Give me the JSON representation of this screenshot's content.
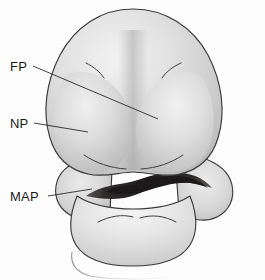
{
  "figure": {
    "background_color": "#fdfdfd",
    "outline_color": "#3a3a3a",
    "fill_light": "#eeeeee",
    "fill_mid": "#c9c9c9",
    "fill_dark": "#a8a8a8",
    "cavity_color": "#221f1f",
    "width": 265,
    "height": 280
  },
  "labels": [
    {
      "id": "fp",
      "text": "FP",
      "meaning": "frontonasal-prominence",
      "text_x": 10,
      "text_y": 71,
      "leader_start_x": 33,
      "leader_start_y": 66,
      "leader_end_x": 158,
      "leader_end_y": 119
    },
    {
      "id": "np",
      "text": "NP",
      "meaning": "nasal-prominence",
      "text_x": 10,
      "text_y": 128,
      "leader_start_x": 34,
      "leader_start_y": 123,
      "leader_end_x": 88,
      "leader_end_y": 132
    },
    {
      "id": "map",
      "text": "MAP",
      "meaning": "maxillary-mandibular-prominence",
      "text_x": 10,
      "text_y": 201,
      "leader_start_x": 48,
      "leader_start_y": 196,
      "leader_end_x": 92,
      "leader_end_y": 189
    }
  ],
  "regions": [
    {
      "id": "frontonasal-prominence",
      "label_ref": "FP"
    },
    {
      "id": "nasal-prominence",
      "label_ref": "NP"
    },
    {
      "id": "maxillary-mandibular-prominence",
      "label_ref": "MAP"
    },
    {
      "id": "stomodeum",
      "label_ref": ""
    }
  ]
}
